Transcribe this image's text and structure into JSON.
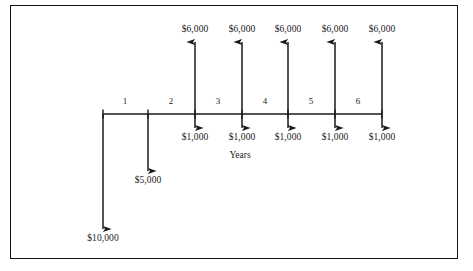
{
  "diagram": {
    "axis_label": "Years",
    "colors": {
      "line": "#1a1a1a",
      "text": "#1a1a1a",
      "border": "#111111",
      "background": "#ffffff"
    },
    "axis": {
      "x_start": 103,
      "x_end": 382,
      "y": 114,
      "tick_positions": [
        103,
        148,
        195,
        242,
        288,
        335,
        382
      ],
      "year_labels": [
        "1",
        "2",
        "3",
        "4",
        "5",
        "6"
      ],
      "year_label_x": [
        125,
        171,
        218,
        265,
        311,
        358
      ],
      "year_label_y": 101
    },
    "inflows": [
      {
        "label": "$6,000",
        "x": 195,
        "label_y": 30,
        "arrow_top": 42
      },
      {
        "label": "$6,000",
        "x": 242,
        "label_y": 30,
        "arrow_top": 42
      },
      {
        "label": "$6,000",
        "x": 288,
        "label_y": 30,
        "arrow_top": 42
      },
      {
        "label": "$6,000",
        "x": 335,
        "label_y": 30,
        "arrow_top": 42
      },
      {
        "label": "$6,000",
        "x": 382,
        "label_y": 30,
        "arrow_top": 42
      }
    ],
    "outflows": [
      {
        "label": "$1,000",
        "x": 195,
        "label_y": 138,
        "arrow_bottom": 128
      },
      {
        "label": "$1,000",
        "x": 242,
        "label_y": 138,
        "arrow_bottom": 128
      },
      {
        "label": "$1,000",
        "x": 288,
        "label_y": 138,
        "arrow_bottom": 128
      },
      {
        "label": "$1,000",
        "x": 335,
        "label_y": 138,
        "arrow_bottom": 128
      },
      {
        "label": "$1,000",
        "x": 382,
        "label_y": 138,
        "arrow_bottom": 128
      },
      {
        "label": "$5,000",
        "x": 148,
        "label_y": 181,
        "arrow_bottom": 171
      },
      {
        "label": "$10,000",
        "x": 103,
        "label_y": 239,
        "arrow_bottom": 229
      }
    ],
    "axis_title_position": {
      "x": 240,
      "y": 156
    }
  },
  "chart_data": {
    "type": "diagram",
    "xlabel": "Years",
    "categories": [
      "0",
      "1",
      "2",
      "3",
      "4",
      "5",
      "6"
    ],
    "series": [
      {
        "name": "Cash inflows",
        "direction": "up",
        "values": [
          0,
          0,
          6000,
          6000,
          6000,
          6000,
          6000
        ],
        "labels": [
          "",
          "",
          "$6,000",
          "$6,000",
          "$6,000",
          "$6,000",
          "$6,000"
        ]
      },
      {
        "name": "Cash outflows",
        "direction": "down",
        "values": [
          10000,
          5000,
          1000,
          1000,
          1000,
          1000,
          1000
        ],
        "labels": [
          "$10,000",
          "$5,000",
          "$1,000",
          "$1,000",
          "$1,000",
          "$1,000",
          "$1,000"
        ]
      }
    ],
    "grid": false,
    "legend": "none"
  }
}
